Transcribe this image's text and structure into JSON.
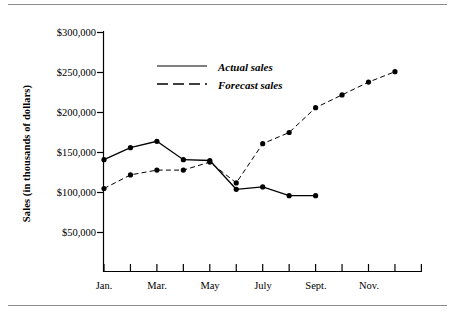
{
  "chart_data": {
    "type": "line",
    "title": "",
    "xlabel": "",
    "ylabel": "Sales (in thousands of dollars)",
    "ylim": [
      0,
      300000
    ],
    "yticks": [
      50000,
      100000,
      150000,
      200000,
      250000,
      300000
    ],
    "ytick_labels": [
      "$50,000",
      "$100,000",
      "$150,000",
      "$200,000",
      "$250,000",
      "$300,000"
    ],
    "x": [
      "Jan.",
      "Feb.",
      "Mar.",
      "Apr.",
      "May",
      "June",
      "July",
      "Aug.",
      "Sept.",
      "Oct.",
      "Nov.",
      "Dec."
    ],
    "xtick_labels": [
      "Jan.",
      "Mar.",
      "May",
      "July",
      "Sept.",
      "Nov."
    ],
    "grid": false,
    "legend_position": "upper center",
    "series": [
      {
        "name": "Actual sales",
        "style": "solid",
        "marker": "filled-circle",
        "values": [
          141000,
          156000,
          164000,
          141000,
          140000,
          104000,
          107000,
          96000,
          96000,
          null,
          null,
          null
        ]
      },
      {
        "name": "Forecast sales",
        "style": "dashed",
        "marker": "filled-circle",
        "values": [
          105000,
          122000,
          128000,
          128000,
          138000,
          112000,
          161000,
          175000,
          206000,
          222000,
          238000,
          251000
        ]
      }
    ]
  },
  "legend": {
    "items": [
      {
        "label": "Actual sales",
        "style": "solid"
      },
      {
        "label": "Forecast sales",
        "style": "dashed"
      }
    ]
  },
  "axes": {
    "y_title": "Sales (in thousands of dollars)",
    "y_ticks": [
      {
        "label": "$300,000"
      },
      {
        "label": "$250,000"
      },
      {
        "label": "$200,000"
      },
      {
        "label": "$150,000"
      },
      {
        "label": "$100,000"
      },
      {
        "label": "$50,000"
      }
    ],
    "x_ticks": [
      {
        "label": "Jan."
      },
      {
        "label": "Mar."
      },
      {
        "label": "May"
      },
      {
        "label": "July"
      },
      {
        "label": "Sept."
      },
      {
        "label": "Nov."
      }
    ]
  }
}
